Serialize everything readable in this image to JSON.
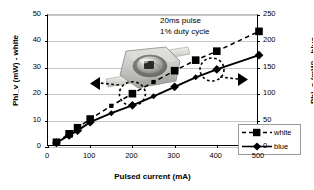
{
  "chart_data": {
    "type": "line",
    "title": "",
    "xlabel": "Pulsed current (mA)",
    "ylabel": "Phi_v (mW) - white",
    "ylabel_right": "Phi_e (mW) - blue",
    "xlim": [
      0,
      500
    ],
    "ylim": [
      0,
      50
    ],
    "ylim_right": [
      0,
      250
    ],
    "xticks": [
      "0",
      "100",
      "200",
      "300",
      "400",
      "500"
    ],
    "yticks_left": [
      "0",
      "10",
      "20",
      "30",
      "40",
      "50"
    ],
    "yticks_right": [
      "0",
      "50",
      "100",
      "150",
      "200",
      "250"
    ],
    "grid": true,
    "legend_position": "lower right",
    "x": [
      20,
      50,
      70,
      100,
      150,
      200,
      250,
      300,
      350,
      400,
      500
    ],
    "series": [
      {
        "name": "white",
        "axis": "left",
        "marker": "square",
        "linestyle": "dashed",
        "color": "#000000",
        "values": [
          1.8,
          5.0,
          7.3,
          10.6,
          15.6,
          20.2,
          24.6,
          28.9,
          32.9,
          36.3,
          43.8
        ]
      },
      {
        "name": "blue",
        "axis": "right",
        "marker": "diamond",
        "linestyle": "solid",
        "color": "#000000",
        "values": [
          8,
          22,
          31,
          47,
          64,
          79,
          96,
          114,
          132,
          147,
          174
        ]
      }
    ],
    "annotations": [
      {
        "id": "pulse-note",
        "lines": [
          "20ms pulse",
          "1% duty cycle"
        ]
      },
      {
        "id": "left-arrow-callout",
        "text": "",
        "points_to": "left-axis",
        "circles_point": "white @ 200 mA"
      },
      {
        "id": "right-arrow-callout",
        "text": "",
        "points_to": "right-axis",
        "circles_point": "blue @ 400 mA"
      }
    ],
    "inset_image": "led-package-photo"
  },
  "legend": {
    "entries": [
      {
        "label": "white"
      },
      {
        "label": "blue"
      }
    ]
  },
  "icons": {
    "left_arrow": "arrow-left-icon",
    "right_arrow": "arrow-right-icon"
  }
}
